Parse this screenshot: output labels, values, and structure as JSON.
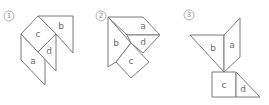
{
  "figures": [
    {
      "number": "1",
      "pieces": [
        {
          "id": "b",
          "label": "b"
        },
        {
          "id": "c",
          "label": "c"
        },
        {
          "id": "d",
          "label": "d"
        },
        {
          "id": "a",
          "label": "a"
        }
      ]
    },
    {
      "number": "2",
      "pieces": [
        {
          "id": "a",
          "label": "a"
        },
        {
          "id": "b",
          "label": "b"
        },
        {
          "id": "d",
          "label": "d"
        },
        {
          "id": "c",
          "label": "c"
        }
      ]
    },
    {
      "number": "3",
      "pieces": [
        {
          "id": "b",
          "label": "b"
        },
        {
          "id": "a",
          "label": "a"
        },
        {
          "id": "c",
          "label": "c"
        },
        {
          "id": "d",
          "label": "d"
        }
      ]
    }
  ]
}
